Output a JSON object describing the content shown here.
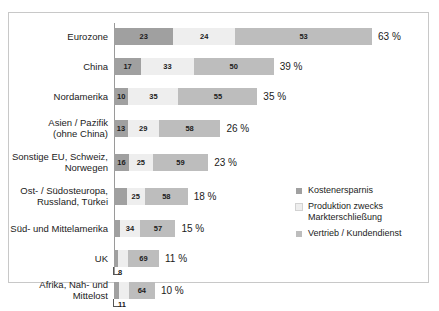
{
  "top_caption": "",
  "chart_data": {
    "type": "bar",
    "subtype": "stacked-horizontal-100pct",
    "title": "",
    "xlabel": "",
    "ylabel": "",
    "grid": false,
    "legend_position": "right-middle",
    "categories": [
      "Eurozone",
      "China",
      "Nordamerika",
      "Asien / Pazifik\n(ohne China)",
      "Sonstige EU, Schweiz,\nNorwegen",
      "Ost- / Südosteuropa,\nRussland, Türkei",
      "Süd- und Mittelamerika",
      "UK",
      "Afrika, Nah- und\nMittelost"
    ],
    "series": [
      {
        "name": "Kostenersparnis",
        "color": "#a0a0a0",
        "values": [
          23,
          17,
          10,
          13,
          16,
          17,
          9,
          8,
          11
        ]
      },
      {
        "name": "Produktion zwecks\nMarkterschließung",
        "color": "#eeeeee",
        "values": [
          24,
          33,
          35,
          29,
          25,
          25,
          34,
          23,
          25
        ]
      },
      {
        "name": "Vertrieb / Kundendienst",
        "color": "#bdbdbd",
        "values": [
          53,
          50,
          55,
          58,
          59,
          58,
          57,
          69,
          64
        ]
      }
    ],
    "totals": [
      63,
      39,
      35,
      26,
      23,
      18,
      15,
      11,
      10
    ],
    "total_labels": [
      "63 %",
      "39 %",
      "35 %",
      "26 %",
      "23 %",
      "18 %",
      "15 %",
      "11 %",
      "10 %"
    ],
    "bar_length_scale": "bar total width is proportional to the category total percentage",
    "max_total": 63
  },
  "rows": [
    {
      "label": "Eurozone",
      "segments": [
        23,
        24,
        53
      ],
      "seg_labels": [
        "23",
        "24",
        "53"
      ],
      "total_label": "63 %",
      "total": 63,
      "callout": null
    },
    {
      "label": "China",
      "segments": [
        17,
        33,
        50
      ],
      "seg_labels": [
        "17",
        "33",
        "50"
      ],
      "total_label": "39 %",
      "total": 39,
      "callout": null
    },
    {
      "label": "Nordamerika",
      "segments": [
        10,
        35,
        55
      ],
      "seg_labels": [
        "10",
        "35",
        "55"
      ],
      "total_label": "35 %",
      "total": 35,
      "callout": null
    },
    {
      "label": "Asien / Pazifik\n(ohne China)",
      "segments": [
        13,
        29,
        58
      ],
      "seg_labels": [
        "13",
        "29",
        "58"
      ],
      "total_label": "26 %",
      "total": 26,
      "callout": null
    },
    {
      "label": "Sonstige EU, Schweiz,\nNorwegen",
      "segments": [
        16,
        25,
        59
      ],
      "seg_labels": [
        "16",
        "25",
        "59"
      ],
      "total_label": "23 %",
      "total": 23,
      "callout": null
    },
    {
      "label": "Ost- / Südosteuropa,\nRussland, Türkei",
      "segments": [
        17,
        25,
        58
      ],
      "seg_labels": [
        "17",
        "25",
        "58"
      ],
      "total_label": "18 %",
      "total": 18,
      "callout": null
    },
    {
      "label": "Süd- und Mittelamerika",
      "segments": [
        9,
        34,
        57
      ],
      "seg_labels": [
        "9",
        "34",
        "57"
      ],
      "total_label": "15 %",
      "total": 15,
      "callout": null
    },
    {
      "label": "UK",
      "segments": [
        8,
        23,
        69
      ],
      "seg_labels": [
        "8",
        "23",
        "69"
      ],
      "total_label": "11 %",
      "total": 11,
      "callout": "8"
    },
    {
      "label": "Afrika, Nah- und\nMittelost",
      "segments": [
        11,
        25,
        64
      ],
      "seg_labels": [
        "11",
        "25",
        "64"
      ],
      "total_label": "10 %",
      "total": 10,
      "callout": "11"
    }
  ],
  "legend": {
    "items": [
      {
        "label": "Kostenersparnis",
        "color": "#a0a0a0"
      },
      {
        "label": "Produktion zwecks\nMarkterschließung",
        "color": "#eeeeee"
      },
      {
        "label": "Vertrieb / Kundendienst",
        "color": "#bdbdbd"
      }
    ]
  }
}
